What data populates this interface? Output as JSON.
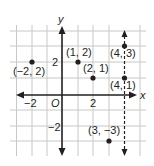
{
  "figure": {
    "axes": {
      "x_label": "x",
      "y_label": "y",
      "origin_label": "O",
      "x_tick_labels": [
        {
          "value": -2,
          "text": "−2"
        },
        {
          "value": 2,
          "text": "2"
        }
      ],
      "y_tick_labels": [
        {
          "value": 2,
          "text": "2"
        },
        {
          "value": -2,
          "text": "−2"
        }
      ],
      "x_range": [
        -3,
        5
      ],
      "y_range": [
        -4,
        4
      ]
    },
    "points": [
      {
        "x": -2,
        "y": 2,
        "label": "(−2, 2)"
      },
      {
        "x": 1,
        "y": 2,
        "label": "(1, 2)"
      },
      {
        "x": 2,
        "y": 1,
        "label": "(2, 1)"
      },
      {
        "x": 4,
        "y": 3,
        "label": "(4, 3)"
      },
      {
        "x": 4,
        "y": 1,
        "label": "(4, 1)"
      },
      {
        "x": 3,
        "y": -3,
        "label": "(3, −3)"
      }
    ],
    "dashed_line": {
      "equation": "x = 4"
    },
    "colors": {
      "ink": "#231f20",
      "grid": "#c8c8c8",
      "background": "#ffffff"
    }
  }
}
